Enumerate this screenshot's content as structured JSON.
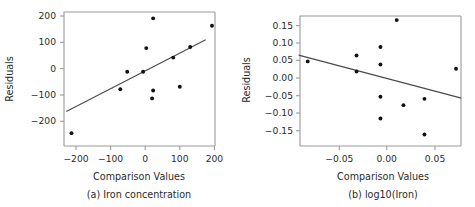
{
  "figure": {
    "background": "#ffffff",
    "point_color": "#111111",
    "line_color": "#4a4a4a",
    "axis_color": "#9a9a9a"
  },
  "chart_data": [
    {
      "type": "scatter",
      "panel_id": "a",
      "title": "",
      "caption": "(a) Iron concentration",
      "xlabel": "Comparison Values",
      "ylabel": "Residuals",
      "xlim": [
        -250,
        215
      ],
      "ylim": [
        -265,
        215
      ],
      "xticks": [
        -200,
        -100,
        0,
        100,
        200
      ],
      "xticklabels": [
        "−200",
        "−100",
        "0",
        "100",
        "200"
      ],
      "yticks": [
        -200,
        -100,
        0,
        100,
        200
      ],
      "yticklabels": [
        "−200",
        "−100",
        "0",
        "100",
        "200"
      ],
      "grid": false,
      "legend": "none",
      "x": [
        -213,
        -72,
        -52,
        -6,
        3,
        20,
        23,
        23,
        81,
        100,
        130,
        193
      ],
      "y": [
        -245,
        -78,
        -12,
        -12,
        78,
        -113,
        191,
        -83,
        42,
        -69,
        82,
        163
      ],
      "reference_line": {
        "name": "qq-reference-line",
        "x_start": -228,
        "y_start": -163,
        "x_end": 175,
        "y_end": 110
      }
    },
    {
      "type": "scatter",
      "panel_id": "b",
      "title": "",
      "caption": "(b) log10(Iron)",
      "xlabel": "Comparison Values",
      "ylabel": "Residuals",
      "xlim": [
        -0.097,
        0.0785
      ],
      "ylim": [
        -0.186,
        0.186
      ],
      "xticks": [
        -0.05,
        0.0,
        0.05
      ],
      "xticklabels": [
        "−0.05",
        "0.00",
        "0.05"
      ],
      "yticks": [
        -0.15,
        -0.1,
        -0.05,
        0.0,
        0.05,
        0.1,
        0.15
      ],
      "yticklabels": [
        "−0.15",
        "−0.10",
        "−0.05",
        "0.00",
        "0.05",
        "0.10",
        "0.15"
      ],
      "grid": false,
      "legend": "none",
      "x": [
        -0.083,
        -0.032,
        -0.032,
        -0.007,
        -0.007,
        -0.007,
        -0.007,
        0.01,
        0.017,
        0.039,
        0.039,
        0.072
      ],
      "y": [
        0.048,
        0.065,
        0.019,
        0.089,
        0.039,
        -0.053,
        -0.115,
        0.166,
        -0.077,
        -0.059,
        -0.161,
        0.027
      ],
      "reference_line": {
        "name": "trend-line",
        "x_start": -0.0925,
        "y_start": 0.066,
        "x_end": 0.0775,
        "y_end": -0.057
      }
    }
  ]
}
